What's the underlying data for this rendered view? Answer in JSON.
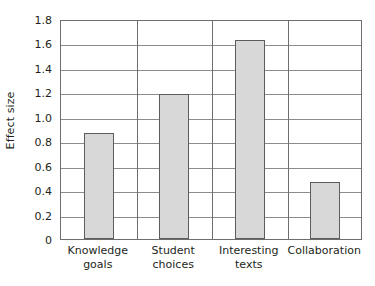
{
  "chart_data": {
    "type": "bar",
    "title": "",
    "xlabel": "",
    "ylabel": "Effect size",
    "categories": [
      "Knowledge goals",
      "Student choices",
      "Interesting texts",
      "Collaboration"
    ],
    "category_lines": [
      [
        "Knowledge",
        "goals"
      ],
      [
        "Student",
        "choices"
      ],
      [
        "Interesting",
        "texts"
      ],
      [
        "Collaboration"
      ]
    ],
    "values": [
      0.87,
      1.19,
      1.63,
      0.47
    ],
    "ylim": [
      0,
      1.8
    ],
    "ytick_labels": [
      "0",
      "0.2",
      "0.4",
      "0.6",
      "0.8",
      "1.0",
      "1.2",
      "1.4",
      "1.6",
      "1.8"
    ],
    "ytick_values": [
      0,
      0.2,
      0.4,
      0.6,
      0.8,
      1.0,
      1.2,
      1.4,
      1.6,
      1.8
    ],
    "grid": "horizontal",
    "legend": "none",
    "colors": {
      "bar_fill": "#d8d8d8",
      "bar_border": "#5c5c5c",
      "gridline": "#8c8c8c",
      "frame": "#6e6e6e",
      "text": "#231f20",
      "background": "#ffffff"
    }
  }
}
